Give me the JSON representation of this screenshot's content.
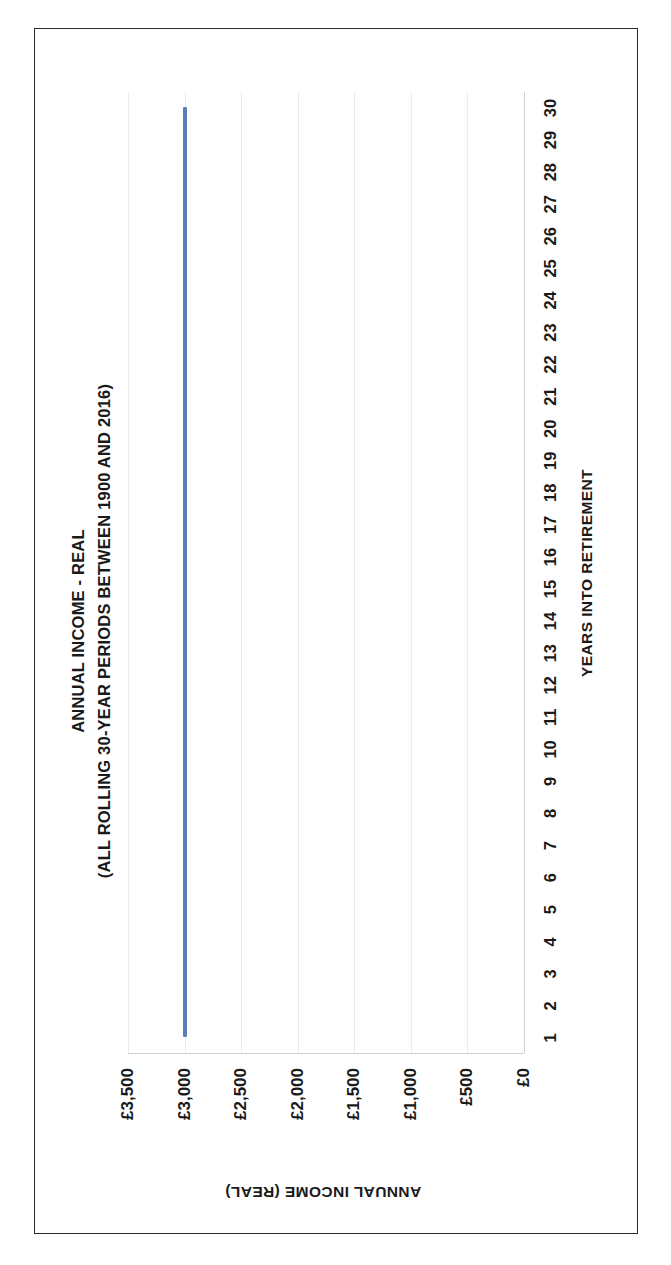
{
  "document": {
    "background_color": "#ffffff",
    "frame_color": "#2b2b2b"
  },
  "chart_data": {
    "type": "line",
    "title": "ANNUAL INCOME - REAL",
    "subtitle": "(ALL ROLLING 30-YEAR PERIODS BETWEEN 1900 AND 2016)",
    "xlabel": "YEARS INTO RETIREMENT",
    "ylabel": "ANNUAL INCOME (REAL)",
    "x": [
      1,
      2,
      3,
      4,
      5,
      6,
      7,
      8,
      9,
      10,
      11,
      12,
      13,
      14,
      15,
      16,
      17,
      18,
      19,
      20,
      21,
      22,
      23,
      24,
      25,
      26,
      27,
      28,
      29,
      30
    ],
    "xticklabels": [
      "1",
      "2",
      "3",
      "4",
      "5",
      "6",
      "7",
      "8",
      "9",
      "10",
      "11",
      "12",
      "13",
      "14",
      "15",
      "16",
      "17",
      "18",
      "19",
      "20",
      "21",
      "22",
      "23",
      "24",
      "25",
      "26",
      "27",
      "28",
      "29",
      "30"
    ],
    "yticks": [
      0,
      500,
      1000,
      1500,
      2000,
      2500,
      3000,
      3500
    ],
    "yticklabels": [
      "£0",
      "£500",
      "£1,000",
      "£1,500",
      "£2,000",
      "£2,500",
      "£3,000",
      "£3,500"
    ],
    "ylim": [
      0,
      3500
    ],
    "grid": true,
    "legend": "none",
    "series": [
      {
        "name": "Annual income (real)",
        "color": "#5b7eb5",
        "line_width_px": 4,
        "values": [
          3000,
          3000,
          3000,
          3000,
          3000,
          3000,
          3000,
          3000,
          3000,
          3000,
          3000,
          3000,
          3000,
          3000,
          3000,
          3000,
          3000,
          3000,
          3000,
          3000,
          3000,
          3000,
          3000,
          3000,
          3000,
          3000,
          3000,
          3000,
          3000,
          3000
        ]
      }
    ],
    "rotation_note": "chart rendered rotated 90 degrees counter-clockwise on the page"
  }
}
